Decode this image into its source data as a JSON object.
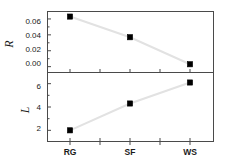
{
  "chart_data": {
    "type": "scatter",
    "title": "",
    "xlabel": "",
    "categories": [
      "RG",
      "SF",
      "WS"
    ],
    "grid": false,
    "legend": "none",
    "panels": [
      {
        "id": "top",
        "ylabel": "R",
        "ylim": [
          -0.008,
          0.07
        ],
        "yticks": [
          0.0,
          0.02,
          0.04,
          0.06
        ],
        "yticklabels": [
          "0.00",
          "0.02",
          "0.04",
          "0.06"
        ],
        "series": [
          {
            "name": "R",
            "marker": "square",
            "marker_color": "#000000",
            "line_color": "#e2e2e2",
            "values": [
              0.063,
              0.037,
              0.003
            ]
          }
        ]
      },
      {
        "id": "bottom",
        "ylabel": "L",
        "ylim": [
          1.0,
          7.0
        ],
        "yticks": [
          2,
          4,
          6
        ],
        "yticklabels": [
          "2",
          "4",
          "6"
        ],
        "series": [
          {
            "name": "L",
            "marker": "square",
            "marker_color": "#000000",
            "line_color": "#e2e2e2",
            "values": [
              2.0,
              4.3,
              6.1
            ]
          }
        ]
      }
    ]
  },
  "axes": {
    "top": {
      "ylabel": "R",
      "ytick_labels": [
        "0.06",
        "0.04",
        "0.02",
        "0.00"
      ]
    },
    "bottom": {
      "ylabel": "L",
      "ytick_labels": [
        "6",
        "4",
        "2"
      ]
    },
    "xtick_labels": [
      "RG",
      "SF",
      "WS"
    ]
  },
  "colors": {
    "marker": "#000000",
    "line": "#e2e2e2",
    "frame": "#4a4a4a",
    "text": "#1a1a1a",
    "background": "#ffffff"
  }
}
